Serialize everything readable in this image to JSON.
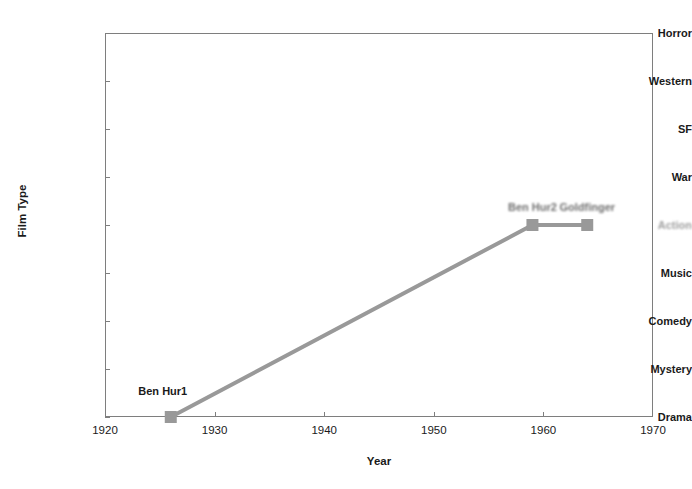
{
  "chart_data": {
    "type": "line",
    "title": "",
    "xlabel": "Year",
    "ylabel": "Film Type",
    "xlim": [
      1920,
      1970
    ],
    "ylim": [
      "Drama",
      "Horror"
    ],
    "grid": false,
    "legend": "none",
    "x_ticks": [
      "1920",
      "1930",
      "1940",
      "1950",
      "1960",
      "1970"
    ],
    "x_tick_values": [
      1920,
      1930,
      1940,
      1950,
      1960,
      1970
    ],
    "y_categories": [
      "Drama",
      "Mystery",
      "Comedy",
      "Music",
      "Action",
      "War",
      "SF",
      "Western",
      "Horror"
    ],
    "series": [
      {
        "name": "Films",
        "marker": "square",
        "color": "#999999",
        "line_color": "#999999",
        "points": [
          {
            "label": "Ben Hur1",
            "x": 1926,
            "y": "Drama",
            "label_dx": -8,
            "label_dy": -32
          },
          {
            "label": "Ben Hur2",
            "x": 1959,
            "y": "Action",
            "label_dx": 0,
            "label_dy": -24,
            "smudged": true
          },
          {
            "label": "Goldfinger",
            "x": 1964,
            "y": "Action",
            "label_dx": 0,
            "label_dy": -24,
            "smudged": true
          }
        ]
      }
    ],
    "annotations": [
      {
        "text": "Action",
        "note": "y-axis tick label rendered faint/degraded in source image"
      }
    ]
  },
  "axis": {
    "y_title": "Film Type",
    "x_title": "Year"
  }
}
